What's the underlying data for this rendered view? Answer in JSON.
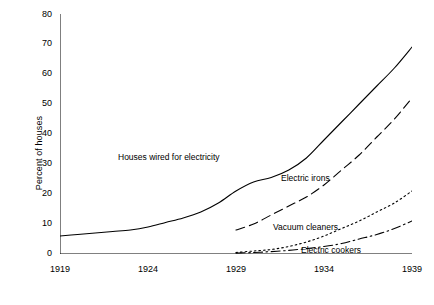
{
  "chart_data": {
    "type": "line",
    "title": "",
    "xlabel": "",
    "ylabel": "Percent of houses",
    "xlim": [
      1919,
      1939
    ],
    "ylim": [
      0,
      80
    ],
    "xticks": [
      "1919",
      "1924",
      "1929",
      "1934",
      "1939"
    ],
    "yticks": [
      "0",
      "10",
      "20",
      "30",
      "40",
      "50",
      "60",
      "70",
      "80"
    ],
    "grid": false,
    "legend_position": "inline-annotations",
    "x": [
      1919,
      1920,
      1921,
      1922,
      1923,
      1924,
      1925,
      1926,
      1927,
      1928,
      1929,
      1930,
      1931,
      1932,
      1933,
      1934,
      1935,
      1936,
      1937,
      1938,
      1939
    ],
    "series": [
      {
        "name": "Houses wired for electricity",
        "style": "solid",
        "values": [
          6,
          6.5,
          7,
          7.5,
          8,
          9,
          10.5,
          12,
          14,
          17,
          21,
          24,
          25.5,
          28,
          32,
          38,
          44,
          50,
          56,
          62,
          69
        ]
      },
      {
        "name": "Electric irons",
        "style": "dashed",
        "values": [
          null,
          null,
          null,
          null,
          null,
          null,
          null,
          null,
          null,
          null,
          8,
          10,
          13,
          16,
          19,
          23,
          28,
          33,
          39,
          45,
          52
        ]
      },
      {
        "name": "Vacuum cleaners",
        "style": "dotted",
        "values": [
          null,
          null,
          null,
          null,
          null,
          null,
          null,
          null,
          null,
          null,
          0.5,
          1,
          1.5,
          2.5,
          4,
          6,
          8.5,
          11,
          14,
          17,
          21
        ]
      },
      {
        "name": "Electric cookers",
        "style": "dash-dot",
        "values": [
          null,
          null,
          null,
          null,
          null,
          null,
          null,
          null,
          null,
          null,
          0.3,
          0.5,
          0.8,
          1.2,
          1.8,
          2.5,
          3.5,
          5,
          6.5,
          8.5,
          11
        ]
      }
    ],
    "annotations": [
      {
        "text": "Houses wired for electricity",
        "x": 1925.4,
        "y": 33
      },
      {
        "text": "Electric irons",
        "x": 1931.3,
        "y": 26
      },
      {
        "text": "Vacuum cleaners",
        "x": 1932.2,
        "y": 9.5
      },
      {
        "text": "Electric cookers",
        "x": 1934.6,
        "y": 1.5
      }
    ],
    "colors": {
      "line": "#000000",
      "axis": "#000000",
      "background": "#ffffff"
    }
  }
}
